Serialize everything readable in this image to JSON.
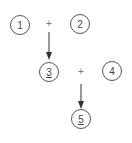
{
  "diagram": {
    "nodes": [
      {
        "id": "n1",
        "label": "1",
        "underlined": false
      },
      {
        "id": "n2",
        "label": "2",
        "underlined": false
      },
      {
        "id": "n3",
        "label": "3",
        "underlined": true
      },
      {
        "id": "n4",
        "label": "4",
        "underlined": false
      },
      {
        "id": "n5",
        "label": "5",
        "underlined": true
      }
    ],
    "operators": [
      {
        "id": "op1",
        "symbol": "+"
      },
      {
        "id": "op2",
        "symbol": "+"
      }
    ],
    "edges": [
      {
        "from": "op1",
        "to": "n3"
      },
      {
        "from": "op2",
        "to": "n5"
      }
    ],
    "colors": {
      "stroke": "#555555",
      "text": "#444444",
      "operator": "#777777"
    }
  }
}
